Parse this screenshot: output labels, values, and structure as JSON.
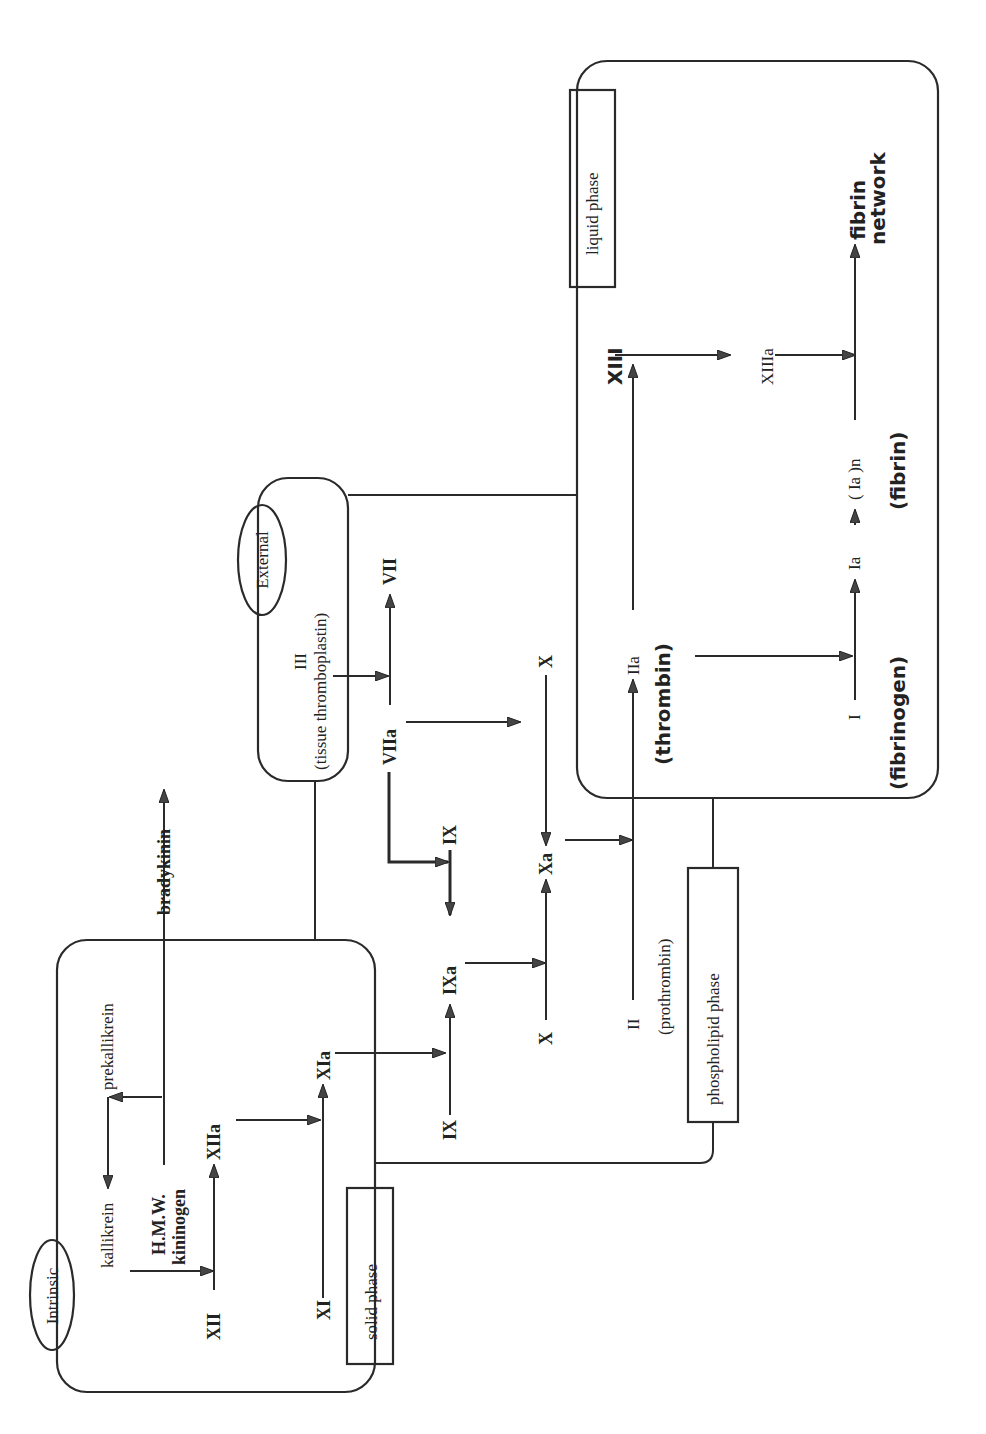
{
  "diagram": {
    "pathways": {
      "intrinsic": "Intrinsic",
      "external": "External"
    },
    "phases": {
      "solid": "solid phase",
      "phospholipid": "phospholipid phase",
      "liquid": "liquid phase"
    },
    "factors": {
      "kallikrein": "kallikrein",
      "prekallikrein": "prekallikrein",
      "hmw1": "H.M.W.",
      "hmw2": "kininogen",
      "bradykinin": "bradykinin",
      "XII": "XII",
      "XIIa": "XIIa",
      "XI": "XI",
      "XIa": "XIa",
      "IX_left": "IX",
      "IXa": "IXa",
      "IX_top": "IX",
      "X_left": "X",
      "Xa": "Xa",
      "X_right": "X",
      "III": "III",
      "tissue_thromboplastin": "(tissue thromboplastin)",
      "VIIa": "VIIa",
      "VII": "VII",
      "II": "II",
      "prothrombin": "(prothrombin)",
      "IIa": "IIa",
      "thrombin": "(thrombin)",
      "I": "I",
      "fibrinogen": "(fibrinogen)",
      "Ia": "Ia",
      "Ia_n": "( Ia )n",
      "fibrin": "(fibrin)",
      "XIII": "XIII",
      "XIIIa": "XIIIa",
      "fibrin_network_1": "fibrin",
      "fibrin_network_2": "network"
    },
    "colors": {
      "line": "#2a2a2a",
      "background": "#ffffff"
    }
  }
}
